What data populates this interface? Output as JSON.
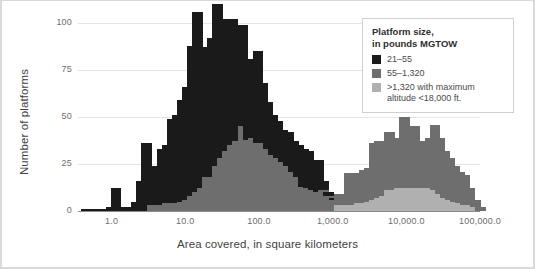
{
  "figure": {
    "background": "#ffffff",
    "border_color": "#d9d9d9"
  },
  "axes": {
    "y_title": "Number of platforms",
    "x_title": "Area covered, in square kilometers",
    "y_ticks": [
      "0",
      "25",
      "50",
      "75",
      "100"
    ],
    "y_tick_values": [
      0,
      25,
      50,
      75,
      100
    ],
    "x_ticks": [
      "1.0",
      "10.0",
      "100.0",
      "1,000.0",
      "10,000.0",
      "100,000.0"
    ],
    "x_tick_values": [
      1,
      10,
      100,
      1000,
      10000,
      100000
    ],
    "x_scale": "log",
    "gridlines": true
  },
  "legend": {
    "title_line1": "Platform size,",
    "title_line2": "in pounds MGTOW",
    "position": "top-right",
    "entries": [
      {
        "label": "21–55",
        "color": "#1a1a1a"
      },
      {
        "label": "55–1,320",
        "color": "#6e6e6e"
      },
      {
        "label": ">1,320 with maximum",
        "label2": "altitude <18,000 ft.",
        "color": "#b0b0b0"
      }
    ]
  },
  "colors": {
    "series1": "#1a1a1a",
    "series2": "#6e6e6e",
    "series3": "#b0b0b0",
    "grid": "#e6e6e6",
    "axis": "#8a8a8a",
    "text": "#4a4a4a",
    "title_text": "#3f3f3f"
  },
  "chart_data": {
    "type": "bar",
    "title": "",
    "subtitle": "",
    "xlabel": "Area covered, in square kilometers",
    "ylabel": "Number of platforms",
    "xscale": "log",
    "xlim": [
      0.35,
      100000
    ],
    "ylim": [
      0,
      100
    ],
    "stacked": true,
    "bin_width_decades": 0.14286,
    "note": "Stacked histogram of unmanned platforms by ground area covered; x is log-scaled with 7 bins per decade. bin_centers are the geometric centers of each bin in square kilometers.",
    "legend": [
      "21–55",
      "55–1,320",
      ">1,320 with maximum altitude <18,000 ft."
    ],
    "bin_left_edges": [
      0.38,
      0.45,
      0.52,
      0.61,
      0.72,
      0.84,
      0.98,
      1.15,
      1.35,
      1.58,
      1.85,
      2.17,
      2.54,
      2.98,
      3.49,
      4.08,
      4.79,
      5.61,
      6.57,
      7.69,
      9.01,
      10.55,
      12.36,
      14.47,
      16.95,
      19.85,
      23.24,
      27.22,
      31.88,
      37.33,
      43.72,
      51.2,
      59.96,
      70.22,
      82.23,
      96.31,
      112.8,
      132.1,
      154.7,
      181.2,
      212.2,
      248.5,
      291.0,
      340.8,
      399.1,
      467.4,
      547.4,
      641.0,
      750.7,
      879.2,
      1029.6,
      1205.8,
      1412.1,
      1653.7,
      1936.6,
      2268.0,
      2656.1,
      3110.7,
      3642.9,
      4266.2,
      4996.1,
      5850.9,
      6852.2,
      8024.8,
      9398.0,
      11005.6,
      12888.4,
      15093.9,
      17677.7,
      20703.3,
      24245.0,
      28392.0,
      33248.0,
      38935.0,
      45595.0,
      53394.0,
      62528.0,
      73225.0,
      85755.0
    ],
    "series": [
      {
        "name": "21–55",
        "color": "#1a1a1a",
        "values": [
          1,
          0,
          1,
          1,
          0,
          2,
          12,
          2,
          2,
          2,
          5,
          16,
          36,
          21,
          21,
          30,
          31,
          45,
          47,
          54,
          60,
          80,
          96,
          72,
          69,
          74,
          86,
          70,
          70,
          67,
          62,
          54,
          43,
          42,
          49,
          32,
          25,
          21,
          20,
          17,
          18,
          16,
          17,
          20,
          20,
          15,
          17,
          5,
          2,
          1,
          0,
          0,
          0,
          0,
          0,
          0,
          0,
          0,
          0,
          0,
          0,
          0,
          0,
          0,
          0,
          0,
          0,
          0,
          0,
          0,
          0,
          0,
          0,
          0,
          0,
          0,
          0,
          0,
          0
        ]
      },
      {
        "name": "55–1,320",
        "color": "#6e6e6e",
        "values": [
          0,
          0,
          0,
          0,
          0,
          0,
          0,
          0,
          0,
          0,
          0,
          0,
          0,
          3,
          3,
          3,
          4,
          4,
          4,
          5,
          6,
          8,
          10,
          12,
          18,
          18,
          24,
          28,
          32,
          35,
          37,
          45,
          38,
          39,
          36,
          36,
          33,
          30,
          28,
          26,
          24,
          21,
          18,
          13,
          12,
          11,
          10,
          11,
          8,
          6,
          6,
          6,
          17,
          16,
          16,
          18,
          18,
          30,
          30,
          29,
          31,
          27,
          27,
          38,
          30,
          33,
          24,
          25,
          27,
          35,
          30,
          25,
          22,
          19,
          17,
          16,
          9,
          4,
          2
        ]
      },
      {
        "name": ">1,320 with maximum altitude <18,000 ft.",
        "color": "#b0b0b0",
        "values": [
          0,
          0,
          0,
          0,
          0,
          0,
          0,
          0,
          0,
          0,
          0,
          0,
          0,
          0,
          0,
          0,
          0,
          0,
          0,
          0,
          0,
          0,
          0,
          0,
          0,
          0,
          0,
          0,
          0,
          0,
          0,
          0,
          0,
          0,
          0,
          0,
          0,
          0,
          0,
          0,
          0,
          0,
          0,
          0,
          0,
          0,
          0,
          0,
          0,
          0,
          3,
          3,
          3,
          3,
          4,
          4,
          5,
          6,
          7,
          8,
          11,
          11,
          12,
          12,
          12,
          12,
          12,
          12,
          12,
          11,
          9,
          7,
          6,
          5,
          4,
          3,
          3,
          2,
          0
        ]
      }
    ]
  }
}
